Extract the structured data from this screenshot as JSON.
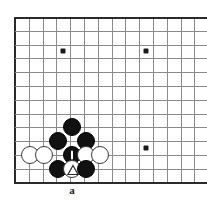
{
  "figure": {
    "type": "go-board-diagram",
    "title": "",
    "board": {
      "cell_size": 13.8,
      "origin_x": 15,
      "origin_y": 17,
      "left_edge_x": 15,
      "top_edge_y": 17,
      "bottom_edge_y": 182,
      "columns": 14,
      "rows": 12,
      "cropped_right": true,
      "line_color": "#8a8a8a",
      "edge_color": "#2b2b2b",
      "background": "#ffffff"
    },
    "star_points": [
      {
        "col": 3,
        "row": 2.5,
        "x": 63,
        "y": 51
      },
      {
        "col": 9,
        "row": 2.5,
        "x": 146,
        "y": 51
      },
      {
        "col": 9,
        "row": 9.5,
        "x": 146,
        "y": 148
      }
    ],
    "stones": [
      {
        "color": "black",
        "x": 72,
        "y": 127,
        "radius": 9,
        "mark": "none",
        "label": "black-stone"
      },
      {
        "color": "black",
        "x": 58,
        "y": 141,
        "radius": 9,
        "mark": "none",
        "label": "black-stone"
      },
      {
        "color": "black",
        "x": 86,
        "y": 141,
        "radius": 9,
        "mark": "none",
        "label": "black-stone"
      },
      {
        "color": "white",
        "x": 30,
        "y": 155,
        "radius": 9,
        "mark": "none",
        "label": "white-stone"
      },
      {
        "color": "white",
        "x": 44,
        "y": 155,
        "radius": 9,
        "mark": "none",
        "label": "white-stone"
      },
      {
        "color": "black",
        "x": 72,
        "y": 155,
        "radius": 9,
        "mark": "tick",
        "label": "black-stone-marked"
      },
      {
        "color": "white",
        "x": 86,
        "y": 155,
        "radius": 9,
        "mark": "none",
        "label": "white-stone"
      },
      {
        "color": "white",
        "x": 100,
        "y": 155,
        "radius": 9,
        "mark": "none",
        "label": "white-stone"
      },
      {
        "color": "black",
        "x": 58,
        "y": 169,
        "radius": 9,
        "mark": "none",
        "label": "black-stone"
      },
      {
        "color": "white",
        "x": 72,
        "y": 169,
        "radius": 9,
        "mark": "triangle",
        "label": "white-stone-triangle"
      },
      {
        "color": "black",
        "x": 86,
        "y": 169,
        "radius": 9,
        "mark": "none",
        "label": "black-stone"
      }
    ],
    "labels": [
      {
        "text": "a",
        "x": 72,
        "y": 185,
        "name": "coordinate-label-a"
      }
    ],
    "colors": {
      "black_stone": "#111111",
      "white_stone": "#ffffff",
      "white_stone_border": "#3a3a3a",
      "grid": "#8a8a8a",
      "edge": "#2b2b2b",
      "label": "#1a1a1a"
    }
  }
}
